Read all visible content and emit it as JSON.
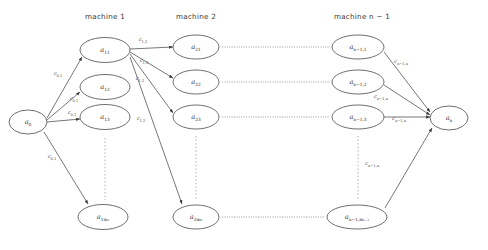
{
  "figure": {
    "type": "layered-graph-diagram",
    "background": "#ffffff",
    "stroke_color": "#4a4a4a",
    "dotted_color": "#8a8a8a"
  },
  "headers": [
    {
      "id": "machine-1",
      "text": "machine 1",
      "x": 105,
      "y": 12
    },
    {
      "id": "machine-2",
      "text": "machine 2",
      "x": 196,
      "y": 12
    },
    {
      "id": "machine-n-1",
      "text": "machine n − 1",
      "x": 362,
      "y": 12
    }
  ],
  "nodes": [
    {
      "id": "a0",
      "base": "a",
      "sub": "0",
      "cx": 28,
      "cy": 122,
      "rx": 19,
      "ry": 12
    },
    {
      "id": "a11",
      "base": "a",
      "sub": "11",
      "cx": 105,
      "cy": 50,
      "rx": 25,
      "ry": 12.5
    },
    {
      "id": "a12",
      "base": "a",
      "sub": "12",
      "cx": 105,
      "cy": 87,
      "rx": 25,
      "ry": 12.5
    },
    {
      "id": "a13",
      "base": "a",
      "sub": "13",
      "cx": 105,
      "cy": 117,
      "rx": 25,
      "ry": 12.5
    },
    {
      "id": "a1m1",
      "base": "a",
      "sub": "1m₁",
      "cx": 103,
      "cy": 217,
      "rx": 25,
      "ry": 12.5
    },
    {
      "id": "a21",
      "base": "a",
      "sub": "21",
      "cx": 196,
      "cy": 47,
      "rx": 23,
      "ry": 12
    },
    {
      "id": "a22",
      "base": "a",
      "sub": "22",
      "cx": 196,
      "cy": 82,
      "rx": 23,
      "ry": 12
    },
    {
      "id": "a23",
      "base": "a",
      "sub": "23",
      "cx": 196,
      "cy": 117,
      "rx": 23,
      "ry": 12
    },
    {
      "id": "a2m2",
      "base": "a",
      "sub": "2m₂",
      "cx": 196,
      "cy": 217,
      "rx": 23,
      "ry": 12
    },
    {
      "id": "an-11",
      "base": "a",
      "sub": "n−1,1",
      "cx": 358,
      "cy": 47,
      "rx": 26,
      "ry": 12
    },
    {
      "id": "an-12",
      "base": "a",
      "sub": "n−1,2",
      "cx": 358,
      "cy": 82,
      "rx": 26,
      "ry": 12
    },
    {
      "id": "an-13",
      "base": "a",
      "sub": "n−1,3",
      "cx": 358,
      "cy": 117,
      "rx": 26,
      "ry": 12
    },
    {
      "id": "an-1mn-1",
      "base": "a",
      "sub": "n−1,mₙ₋₁",
      "cx": 357,
      "cy": 217,
      "rx": 30,
      "ry": 12
    },
    {
      "id": "an",
      "base": "a",
      "sub": "n",
      "cx": 449,
      "cy": 118,
      "rx": 19,
      "ry": 12
    }
  ],
  "edges": [
    {
      "id": "a0-a11",
      "from": "a0",
      "to": "a11",
      "x1": 47,
      "y1": 118,
      "x2": 82,
      "y2": 57
    },
    {
      "id": "a0-a12",
      "from": "a0",
      "to": "a12",
      "x1": 47,
      "y1": 120,
      "x2": 80,
      "y2": 92
    },
    {
      "id": "a0-a13",
      "from": "a0",
      "to": "a13",
      "x1": 47,
      "y1": 122,
      "x2": 80,
      "y2": 119
    },
    {
      "id": "a0-a1m1",
      "from": "a0",
      "to": "a1m1",
      "x1": 44,
      "y1": 132,
      "x2": 88,
      "y2": 204
    },
    {
      "id": "a11-a21",
      "from": "a11",
      "to": "a21",
      "x1": 130,
      "y1": 49,
      "x2": 173,
      "y2": 47
    },
    {
      "id": "a11-a22",
      "from": "a11",
      "to": "a22",
      "x1": 130,
      "y1": 52,
      "x2": 173,
      "y2": 78
    },
    {
      "id": "a11-a23",
      "from": "a11",
      "to": "a23",
      "x1": 130,
      "y1": 54,
      "x2": 173,
      "y2": 113
    },
    {
      "id": "a11-a2m2",
      "from": "a11",
      "to": "a2m2",
      "x1": 130,
      "y1": 57,
      "x2": 182,
      "y2": 204
    },
    {
      "id": "an-11-an",
      "from": "an-11",
      "to": "an",
      "x1": 384,
      "y1": 52,
      "x2": 430,
      "y2": 112
    },
    {
      "id": "an-12-an",
      "from": "an-12",
      "to": "an",
      "x1": 384,
      "y1": 85,
      "x2": 430,
      "y2": 115
    },
    {
      "id": "an-13-an",
      "from": "an-13",
      "to": "an",
      "x1": 384,
      "y1": 117,
      "x2": 430,
      "y2": 117
    },
    {
      "id": "an-1mn-1-an",
      "from": "an-1mn-1",
      "to": "an",
      "x1": 385,
      "y1": 208,
      "x2": 432,
      "y2": 128
    }
  ],
  "edge_labels": [
    {
      "id": "c01-a",
      "base": "c",
      "sub": "0,1",
      "x": 58,
      "y": 75
    },
    {
      "id": "c01-b",
      "base": "c",
      "sub": "0,1",
      "x": 74,
      "y": 100
    },
    {
      "id": "c01-c",
      "base": "c",
      "sub": "0,1",
      "x": 72,
      "y": 114
    },
    {
      "id": "c01-d",
      "base": "c",
      "sub": "0,1",
      "x": 52,
      "y": 158
    },
    {
      "id": "c12-a",
      "base": "c",
      "sub": "1,2",
      "x": 143,
      "y": 41
    },
    {
      "id": "c12-b",
      "base": "c",
      "sub": "1,2",
      "x": 144,
      "y": 62
    },
    {
      "id": "c12-c",
      "base": "c",
      "sub": "1,2",
      "x": 140,
      "y": 80
    },
    {
      "id": "c12-d",
      "base": "c",
      "sub": "1,2",
      "x": 141,
      "y": 120
    },
    {
      "id": "cn1n-a",
      "base": "c",
      "sub": "n−1,n",
      "x": 401,
      "y": 63
    },
    {
      "id": "cn1n-b",
      "base": "c",
      "sub": "n−1,n",
      "x": 381,
      "y": 98
    },
    {
      "id": "cn1n-c",
      "base": "c",
      "sub": "n−1,n",
      "x": 399,
      "y": 120
    },
    {
      "id": "cn1n-d",
      "base": "c",
      "sub": "n−1,n",
      "x": 372,
      "y": 165
    }
  ],
  "vertical_dots": [
    {
      "id": "vdots-col1",
      "x": 105,
      "y1": 138,
      "y2": 200
    },
    {
      "id": "vdots-col2",
      "x": 196,
      "y1": 136,
      "y2": 200
    },
    {
      "id": "vdots-coln",
      "x": 358,
      "y1": 136,
      "y2": 200
    }
  ],
  "horizontal_dots": [
    {
      "id": "hdots-row1",
      "y": 47,
      "x1": 222,
      "x2": 330
    },
    {
      "id": "hdots-row2",
      "y": 82,
      "x1": 222,
      "x2": 330
    },
    {
      "id": "hdots-row3",
      "y": 117,
      "x1": 222,
      "x2": 330
    },
    {
      "id": "hdots-row4",
      "y": 217,
      "x1": 222,
      "x2": 325
    }
  ]
}
